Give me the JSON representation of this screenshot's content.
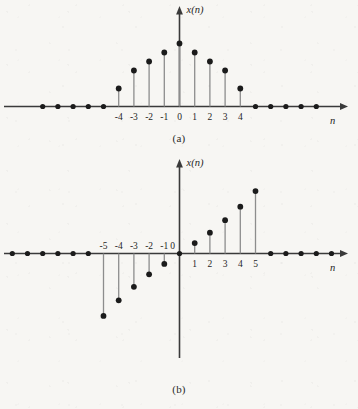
{
  "figure": {
    "background_color": "#f7f6f3",
    "ink_color": "#1b1b1b",
    "stem_color": "#8d8d8d",
    "axis_color": "#3a3a3a"
  },
  "panels": [
    {
      "id": "a",
      "caption": "(a)",
      "y_axis_label": "x(n)",
      "x_axis_label": "n",
      "symmetry": "even"
    },
    {
      "id": "b",
      "caption": "(b)",
      "y_axis_label": "x(n)",
      "x_axis_label": "n",
      "symmetry": "odd"
    }
  ],
  "chart_data": [
    {
      "type": "scatter",
      "plot_style": "stem",
      "title": "(a)",
      "xlabel": "n",
      "ylabel": "x(n)",
      "symmetry": "even",
      "grid": false,
      "legend": null,
      "xlim": [
        -9,
        9
      ],
      "ylim": [
        0,
        8
      ],
      "x": [
        -9,
        -8,
        -7,
        -6,
        -5,
        -4,
        -3,
        -2,
        -1,
        0,
        1,
        2,
        3,
        4,
        5,
        6,
        7,
        8,
        9
      ],
      "values": [
        0,
        0,
        0,
        0,
        0,
        2,
        4,
        5,
        6,
        7,
        6,
        5,
        4,
        2,
        0,
        0,
        0,
        0,
        0
      ],
      "tick_labels": [
        "-4",
        "-3",
        "-2",
        "-1",
        "0",
        "1",
        "2",
        "3",
        "4"
      ],
      "tick_positions": [
        -4,
        -3,
        -2,
        -1,
        0,
        1,
        2,
        3,
        4
      ],
      "tick_label_side": "below",
      "zero_samples_left": 4,
      "zero_samples_right": 5
    },
    {
      "type": "scatter",
      "plot_style": "stem",
      "title": "(b)",
      "xlabel": "n",
      "ylabel": "x(n)",
      "symmetry": "odd",
      "grid": false,
      "legend": null,
      "xlim": [
        -11,
        11
      ],
      "ylim": [
        -7,
        7
      ],
      "x": [
        -11,
        -10,
        -9,
        -8,
        -7,
        -6,
        -5,
        -4,
        -3,
        -2,
        -1,
        0,
        1,
        2,
        3,
        4,
        5,
        6,
        7,
        8,
        9,
        10,
        11
      ],
      "values": [
        0,
        0,
        0,
        0,
        0,
        0,
        -6,
        -4.5,
        -3.2,
        -2,
        -1,
        0,
        1,
        2,
        3.2,
        4.5,
        6,
        0,
        0,
        0,
        0,
        0,
        0
      ],
      "tick_labels_negative": [
        "-5",
        "-4",
        "-3",
        "-2",
        "-1"
      ],
      "tick_positions_negative": [
        -5,
        -4,
        -3,
        -2,
        -1
      ],
      "tick_label_zero": "0",
      "tick_labels_positive": [
        "1",
        "2",
        "3",
        "4",
        "5"
      ],
      "tick_positions_positive": [
        1,
        2,
        3,
        4,
        5
      ],
      "negative_tick_label_side": "above",
      "positive_tick_label_side": "below",
      "zero_samples_left": 5,
      "zero_samples_right": 5
    }
  ]
}
